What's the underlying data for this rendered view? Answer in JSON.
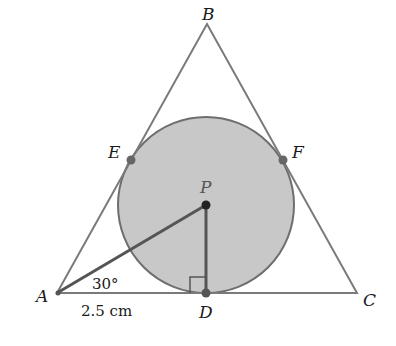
{
  "diagram": {
    "type": "triangle-with-inscribed-circle",
    "colors": {
      "circle_fill": "#c8c8c8",
      "circle_stroke": "#6e6e6e",
      "triangle_stroke": "#7a7a7a",
      "segment_stroke": "#555555",
      "point_fill": "#666666",
      "center_fill": "#222222"
    },
    "vertices": {
      "A": {
        "label": "A"
      },
      "B": {
        "label": "B"
      },
      "C": {
        "label": "C"
      }
    },
    "tangent_points": {
      "D": {
        "label": "D"
      },
      "E": {
        "label": "E"
      },
      "F": {
        "label": "F"
      }
    },
    "center": {
      "label": "P"
    },
    "angle_label": "30°",
    "length_label": "2.5 cm"
  }
}
